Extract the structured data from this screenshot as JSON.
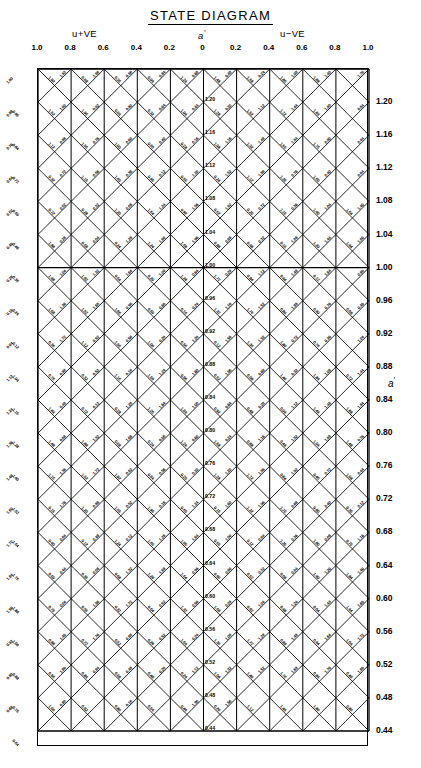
{
  "title": "STATE  DIAGRAM",
  "axes": {
    "top": {
      "groups": [
        {
          "name": "u-plus-ve",
          "text": "u+VE",
          "prime": "′"
        },
        {
          "name": "a-prime-center",
          "text": "a",
          "prime": "′"
        },
        {
          "name": "u-minus-ve",
          "text": "u−VE",
          "prime": "′"
        }
      ],
      "ticks": [
        "1.0",
        "0.8",
        "0.6",
        "0.4",
        "0.2",
        "0",
        "0.2",
        "0.4",
        "0.6",
        "0.8",
        "1.0"
      ]
    },
    "right": {
      "label": "a",
      "label_prime": "′",
      "ticks": [
        "1.20",
        "1.16",
        "1.12",
        "1.08",
        "1.04",
        "1.00",
        "0.96",
        "0.92",
        "0.88",
        "0.84",
        "0.80",
        "0.76",
        "0.72",
        "0.68",
        "0.64",
        "0.60",
        "0.56",
        "0.52",
        "0.48",
        "0.44"
      ]
    }
  },
  "center_line_labels": [
    "1.20",
    "1.16",
    "1.12",
    "1.08",
    "1.04",
    "1.00",
    "0.96",
    "0.92",
    "0.88",
    "0.84",
    "0.80",
    "0.76",
    "0.72",
    "0.68",
    "0.64",
    "0.60",
    "0.56",
    "0.52",
    "0.48",
    "0.44"
  ],
  "grid": {
    "columns": 10,
    "rows": 20,
    "highlight_row_value": "1.00",
    "cell_px": 33.1
  },
  "chart_data": {
    "type": "line",
    "title": "STATE  DIAGRAM",
    "xlabel": "a′",
    "ylabel": "a′",
    "grid": true,
    "legend": "none",
    "xlim": [
      -1.0,
      1.0
    ],
    "ylim": [
      0.44,
      1.2
    ],
    "x_tick_values": [
      -1.0,
      -0.8,
      -0.6,
      -0.4,
      -0.2,
      0,
      0.2,
      0.4,
      0.6,
      0.8,
      1.0
    ],
    "x_tick_labels": [
      "1.0",
      "0.8",
      "0.6",
      "0.4",
      "0.2",
      "0",
      "0.2",
      "0.4",
      "0.6",
      "0.8",
      "1.0"
    ],
    "y_tick_values": [
      1.2,
      1.16,
      1.12,
      1.08,
      1.04,
      1.0,
      0.96,
      0.92,
      0.88,
      0.84,
      0.8,
      0.76,
      0.72,
      0.68,
      0.64,
      0.6,
      0.56,
      0.52,
      0.48,
      0.44
    ],
    "y_tick_labels": [
      "1.20",
      "1.16",
      "1.12",
      "1.08",
      "1.04",
      "1.00",
      "0.96",
      "0.92",
      "0.88",
      "0.84",
      "0.80",
      "0.76",
      "0.72",
      "0.68",
      "0.64",
      "0.60",
      "0.56",
      "0.52",
      "0.48",
      "0.44"
    ],
    "annotations": {
      "left_group": "u′+VE",
      "center_group": "a′",
      "right_group": "u′−VE",
      "emphasised_gridline": 1.0
    },
    "series": [
      {
        "name": "vertical-grid-lines",
        "orientation": "vertical",
        "values": [
          -1.0,
          -0.8,
          -0.6,
          -0.4,
          -0.2,
          0,
          0.2,
          0.4,
          0.6,
          0.8,
          1.0
        ]
      },
      {
        "name": "diagonal-up-lines",
        "orientation": "diagonal",
        "slope": 1,
        "count": 30
      },
      {
        "name": "diagonal-down-lines",
        "orientation": "diagonal",
        "slope": -1,
        "count": 30
      }
    ],
    "diagonal_label_values": [
      "1.00",
      "0.96",
      "0.92",
      "0.88",
      "0.84",
      "0.80",
      "0.76",
      "0.72",
      "0.68",
      "0.64",
      "0.60",
      "0.56",
      "0.52",
      "0.48",
      "0.44",
      "0.40",
      "0.36",
      "0.32",
      "0.28",
      "0.24",
      "0.20",
      "0.16",
      "0.12",
      "0.08",
      "0.04",
      "1.04",
      "1.08",
      "1.12",
      "1.16",
      "1.20",
      "1.24",
      "1.28",
      "1.32",
      "1.36",
      "1.40",
      "1.44",
      "1.48",
      "1.52",
      "1.56",
      "1.60",
      "1.64",
      "1.68",
      "1.72",
      "1.76",
      "1.80",
      "1.84",
      "1.88",
      "1.92",
      "1.96"
    ]
  }
}
